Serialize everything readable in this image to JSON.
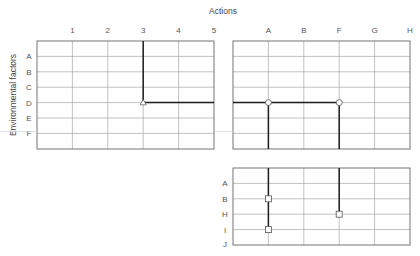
{
  "diagram": {
    "x_axis_title": "Actions",
    "y_axis_title": "Environmental factors",
    "grid_main_left": {
      "columns": [
        "1",
        "2",
        "3",
        "4",
        "5"
      ],
      "rows": [
        "A",
        "B",
        "C",
        "D",
        "E",
        "F"
      ],
      "markers": [
        {
          "shape": "triangle",
          "col": "3",
          "row": "D"
        }
      ],
      "paths": [
        "vertical line from top down col 3 to row D",
        "horizontal line from col 3 to col 5 at row D"
      ]
    },
    "grid_main_right": {
      "columns": [
        "A",
        "B",
        "F",
        "G",
        "H"
      ],
      "markers": [
        {
          "shape": "circle",
          "col": "A",
          "row": "D"
        },
        {
          "shape": "circle",
          "col": "F",
          "row": "D"
        }
      ],
      "paths": [
        "horizontal line from left edge to col F at row D",
        "vertical lines down from col A and col F"
      ]
    },
    "grid_bottom": {
      "rows": [
        "A",
        "B",
        "H",
        "I",
        "J"
      ],
      "markers": [
        {
          "shape": "square",
          "col": "A",
          "row": "B"
        },
        {
          "shape": "square",
          "col": "A",
          "row": "I"
        },
        {
          "shape": "square",
          "col": "F",
          "row": "H"
        }
      ]
    }
  },
  "colors": {
    "grid": "#9a9a9a",
    "frame": "#555555",
    "path": "#222222"
  }
}
